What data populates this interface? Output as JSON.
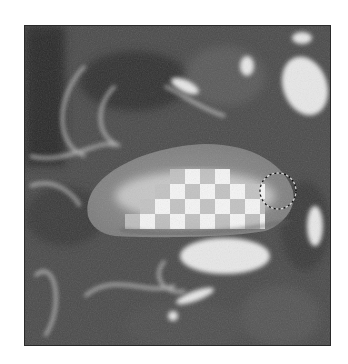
{
  "canvas": {
    "description": "Grayscale photo layer partially erased, revealing transparency checkerboard",
    "tool": "eraser",
    "brush_cursor": {
      "shape": "circle",
      "cx": 253,
      "cy": 165,
      "r": 18
    },
    "checker": {
      "cell_size": 15,
      "light": "#f4f4f4",
      "dark": "#bdbdbd"
    },
    "overlay_color": "#8a8a8a",
    "icons": [
      "eraser-brush-cursor-icon"
    ]
  }
}
